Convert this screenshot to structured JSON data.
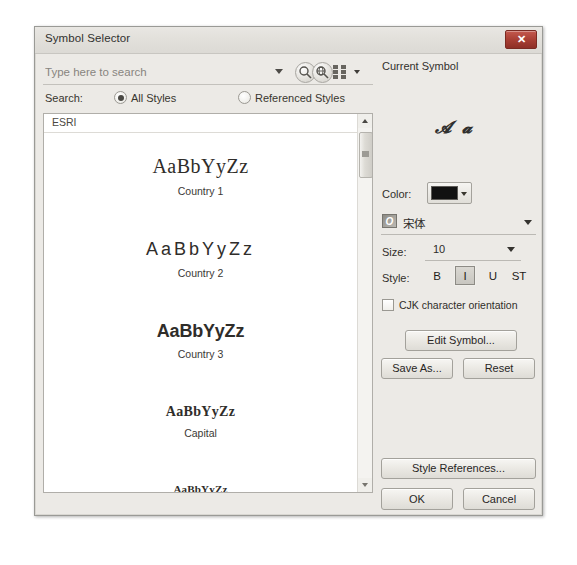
{
  "window": {
    "title": "Symbol Selector",
    "close_label": "✕",
    "close_icon": "close-icon"
  },
  "search": {
    "placeholder": "Type here to search",
    "value": "",
    "dropdown_icon": "chevron-down-icon",
    "search_icon": "magnifier-icon",
    "search_advanced_icon": "magnifier-globe-icon",
    "view_mode_icon": "grid-view-icon",
    "view_mode_arrow_icon": "chevron-down-icon",
    "label": "Search:",
    "options": [
      {
        "label": "All Styles",
        "checked": true
      },
      {
        "label": "Referenced Styles",
        "checked": false
      }
    ]
  },
  "symbol_list": {
    "category": "ESRI",
    "items": [
      {
        "preview": "AaBbYyZz",
        "name": "Country 1",
        "style": "prev-serif"
      },
      {
        "preview": "AaBbYyZz",
        "name": "Country 2",
        "style": "prev-sans-wide"
      },
      {
        "preview": "AaBbYyZz",
        "name": "Country 3",
        "style": "prev-sans-bold"
      },
      {
        "preview": "AaBbYyZz",
        "name": "Capital",
        "style": "prev-serif-bold"
      },
      {
        "preview": "AaBbYyZz",
        "name": "",
        "style": "prev-serif-sm"
      }
    ],
    "scroll_up_icon": "triangle-up-icon",
    "scroll_down_icon": "triangle-down-icon",
    "scroll_thumb_icon": "scrollbar-thumb"
  },
  "current_symbol": {
    "label": "Current Symbol",
    "preview_glyphs": "𝓐𝓪"
  },
  "properties": {
    "color_label": "Color:",
    "color_value": "#111111",
    "color_arrow_icon": "chevron-down-icon",
    "font_name": "宋体",
    "font_icon_glyph": "O",
    "font_arrow_icon": "chevron-down-icon",
    "size_label": "Size:",
    "size_value": "10",
    "size_arrow_icon": "chevron-down-icon",
    "style_label": "Style:",
    "style_buttons": [
      {
        "label": "B",
        "name": "bold-button",
        "active": false
      },
      {
        "label": "I",
        "name": "italic-button",
        "active": true
      },
      {
        "label": "U",
        "name": "underline-button",
        "active": false
      },
      {
        "label": "ST",
        "name": "strikethrough-button",
        "active": false
      }
    ],
    "cjk_label": "CJK character orientation",
    "cjk_checked": false
  },
  "buttons": {
    "edit_symbol": "Edit Symbol...",
    "save_as": "Save As...",
    "reset": "Reset",
    "style_references": "Style References...",
    "ok": "OK",
    "cancel": "Cancel"
  }
}
